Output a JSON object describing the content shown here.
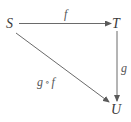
{
  "diagram": {
    "type": "commutative-diagram",
    "nodes": [
      {
        "id": "S",
        "label": "S",
        "x": 10,
        "y": 25
      },
      {
        "id": "T",
        "label": "T",
        "x": 116,
        "y": 25
      },
      {
        "id": "U",
        "label": "U",
        "x": 116,
        "y": 109
      }
    ],
    "edges": [
      {
        "from": "S",
        "to": "T",
        "label": "f"
      },
      {
        "from": "T",
        "to": "U",
        "label": "g"
      },
      {
        "from": "S",
        "to": "U",
        "label_left": "g",
        "label_op": "∘",
        "label_right": "f"
      }
    ],
    "colors": {
      "stroke": "#6a6a6a",
      "text": "#3a3a3a"
    }
  }
}
